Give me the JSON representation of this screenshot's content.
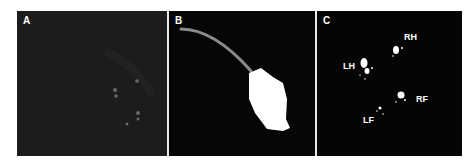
{
  "figure": {
    "panels": [
      {
        "id": "A",
        "label": "A",
        "content": "raw dark frame with faint paw prints"
      },
      {
        "id": "B",
        "label": "B",
        "content": "body silhouette with tail"
      },
      {
        "id": "C",
        "label": "C",
        "content": "detected paw prints"
      }
    ],
    "paw_labels": {
      "rh": "RH",
      "lh": "LH",
      "rf": "RF",
      "lf": "LF"
    },
    "colors": {
      "panel_a_bg": "#1c1c1c",
      "panel_b_bg": "#060606",
      "panel_c_bg": "#050505",
      "silhouette": "#ffffff",
      "tail": "#8a8a8a"
    }
  }
}
